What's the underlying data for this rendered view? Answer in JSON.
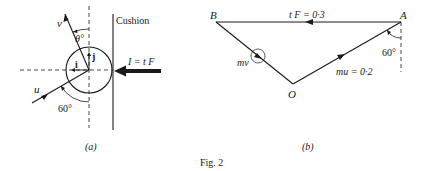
{
  "figure": {
    "caption": "Fig. 2",
    "panel_a": {
      "label": "(a)",
      "cushion_label": "Cushion",
      "velocity_after_label": "v",
      "velocity_before_label": "u",
      "angle_theta_label": "θ°",
      "angle_60_label": "60°",
      "unit_i_label": "i",
      "unit_j_label": "j",
      "impulse_label": "I = t F"
    },
    "panel_b": {
      "label": "(b)",
      "point_A": "A",
      "point_B": "B",
      "point_O": "O",
      "side_AB_label": "t F = 0·3",
      "side_OA_label": "mu = 0·2",
      "side_OB_label": "mv",
      "angle_A_label": "60°"
    }
  },
  "colors": {
    "ink": "#1a1a1a",
    "background": "#ffffff"
  }
}
